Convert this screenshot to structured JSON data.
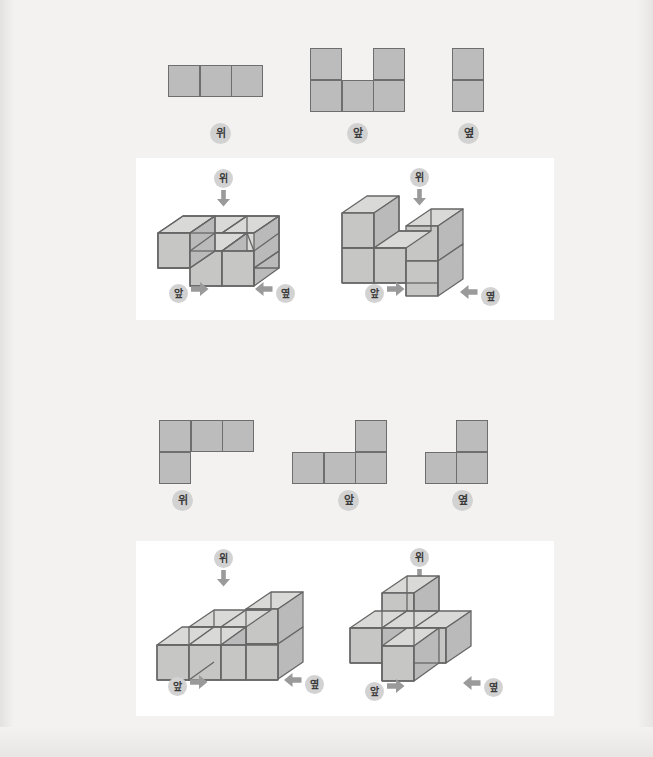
{
  "page": {
    "background_color": "#f3f2f1",
    "panel_color": "#ffffff",
    "square_fill": "#bcbcbc",
    "square_stroke": "#6e6e6e",
    "badge_fill": "#d2d2d2",
    "arrow_color": "#9a9a9a",
    "cube_top_fill": "#d8d8d6",
    "cube_left_fill": "#c4c4c2",
    "cube_right_fill": "#bdbdbb",
    "cube_stroke": "#666666"
  },
  "labels": {
    "top": "위",
    "front": "앞",
    "side": "옆"
  },
  "icons": {
    "down_arrow": "arrow-down-icon",
    "right_arrow": "arrow-right-icon",
    "left_arrow": "arrow-left-icon"
  },
  "problems": [
    {
      "id": "problem-1",
      "views": [
        {
          "name": "top-view",
          "label": "위",
          "cells": [
            [
              1,
              1,
              1
            ]
          ],
          "cols": 3,
          "rows": 1
        },
        {
          "name": "front-view",
          "label": "앞",
          "cells": [
            [
              1,
              0,
              1
            ],
            [
              1,
              1,
              1
            ]
          ],
          "cols": 3,
          "rows": 2
        },
        {
          "name": "side-view",
          "label": "옆",
          "cells": [
            [
              1
            ],
            [
              1
            ]
          ],
          "cols": 1,
          "rows": 2
        }
      ],
      "solids": [
        {
          "name": "solid-left",
          "top_label": "위",
          "front_label": "앞",
          "side_label": "옆",
          "cubes": 5,
          "description": "L-shaped single layer of cubes"
        },
        {
          "name": "solid-right",
          "top_label": "위",
          "front_label": "앞",
          "side_label": "옆",
          "cubes": 5,
          "description": "U-shaped two-layer stack of cubes"
        }
      ]
    },
    {
      "id": "problem-2",
      "views": [
        {
          "name": "top-view",
          "label": "위",
          "cells": [
            [
              1,
              1,
              1
            ],
            [
              1,
              0,
              0
            ]
          ],
          "cols": 3,
          "rows": 2
        },
        {
          "name": "front-view",
          "label": "앞",
          "cells": [
            [
              0,
              0,
              1
            ],
            [
              1,
              1,
              1
            ]
          ],
          "cols": 3,
          "rows": 2
        },
        {
          "name": "side-view",
          "label": "옆",
          "cells": [
            [
              0,
              1
            ],
            [
              1,
              1
            ]
          ],
          "cols": 2,
          "rows": 2
        }
      ],
      "solids": [
        {
          "name": "solid-left",
          "top_label": "위",
          "front_label": "앞",
          "side_label": "옆",
          "cubes": 5,
          "description": "Row of cubes with one stacked at right end"
        },
        {
          "name": "solid-right",
          "top_label": "위",
          "front_label": "앞",
          "side_label": "옆",
          "cubes": 4,
          "description": "T-shaped arrangement with one cube stacked on top"
        }
      ]
    }
  ]
}
